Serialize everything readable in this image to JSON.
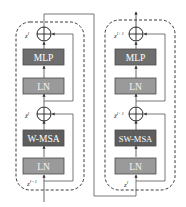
{
  "diagram": {
    "type": "swin-transformer-blocks",
    "colors": {
      "background": "#ffffff",
      "line": "#555555",
      "dashed_border": "#3a3a3a",
      "msa_box": "#5e5e5e",
      "mlp_box": "#6e6e6e",
      "ln_box": "#9a9a9a",
      "box_border": "#4a4a4a"
    },
    "blocks": [
      {
        "id": "block-left",
        "layers": [
          {
            "id": "mlp",
            "label": "MLP"
          },
          {
            "id": "ln-top",
            "label": "LN"
          },
          {
            "id": "msa",
            "label": "W-MSA"
          },
          {
            "id": "ln-bottom",
            "label": "LN"
          }
        ],
        "labels": {
          "output": {
            "base": "z",
            "sup": "l"
          },
          "middle": {
            "base": "ẑ",
            "sup": "l"
          },
          "input": {
            "base": "z",
            "sup": "l−1"
          }
        }
      },
      {
        "id": "block-right",
        "layers": [
          {
            "id": "mlp",
            "label": "MLP"
          },
          {
            "id": "ln-top",
            "label": "LN"
          },
          {
            "id": "msa",
            "label": "SW-MSA"
          },
          {
            "id": "ln-bottom",
            "label": "LN"
          }
        ],
        "labels": {
          "output": {
            "base": "z",
            "sup": "l+1"
          },
          "middle": {
            "base": "ẑ",
            "sup": "l+1"
          },
          "input": {
            "base": "z",
            "sup": "l"
          }
        }
      }
    ],
    "adder_symbol": "⊕"
  }
}
